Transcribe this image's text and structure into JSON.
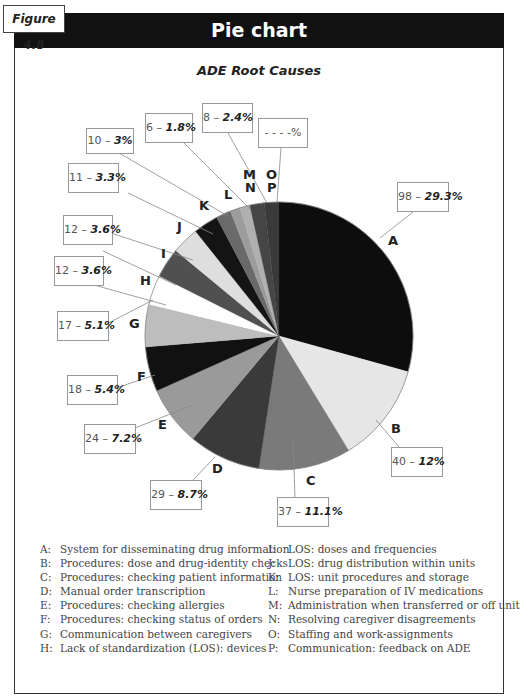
{
  "figure_label": "Figure 4.8",
  "header_title": "Pie chart",
  "chart_data": {
    "type": "pie",
    "title": "ADE Root Causes",
    "start_angle": "12 o'clock, clockwise",
    "slices": [
      {
        "key": "A",
        "count": 98,
        "percent": 29.3,
        "label": "System for disseminating drug information",
        "color": "#0d0d0d"
      },
      {
        "key": "B",
        "count": 40,
        "percent": 12,
        "label": "Procedures: dose and drug-identity checks",
        "color": "#e6e6e6"
      },
      {
        "key": "C",
        "count": 37,
        "percent": 11.1,
        "label": "Procedures: checking patient information",
        "color": "#7a7a7a"
      },
      {
        "key": "D",
        "count": 29,
        "percent": 8.7,
        "label": "Manual order transcription",
        "color": "#3a3a3a"
      },
      {
        "key": "E",
        "count": 24,
        "percent": 7.2,
        "label": "Procedures: checking allergies",
        "color": "#9a9a9a"
      },
      {
        "key": "F",
        "count": 18,
        "percent": 5.4,
        "label": "Procedures: checking status of orders",
        "color": "#111111"
      },
      {
        "key": "G",
        "count": 17,
        "percent": 5.1,
        "label": "Communication between caregivers",
        "color": "#bdbdbd"
      },
      {
        "key": "H",
        "count": 12,
        "percent": 3.6,
        "label": "Lack of standardization (LOS): devices",
        "color": "#ffffff"
      },
      {
        "key": "I",
        "count": 12,
        "percent": 3.6,
        "label": "LOS: doses and frequencies",
        "color": "#505050"
      },
      {
        "key": "J",
        "count": 11,
        "percent": 3.3,
        "label": "LOS: drug distribution within units",
        "color": "#dedede"
      },
      {
        "key": "K",
        "count": 10,
        "percent": 3,
        "label": "LOS: unit procedures and storage",
        "color": "#141414"
      },
      {
        "key": "L",
        "count": 6,
        "percent": 1.8,
        "label": "Nurse preparation of IV medications",
        "color": "#6a6a6a"
      },
      {
        "key": "M",
        "count": null,
        "percent": null,
        "label": "Administration when transferred or off unit",
        "color": "#9c9c9c"
      },
      {
        "key": "N",
        "count": null,
        "percent": null,
        "label": "Resolving caregiver disagreements",
        "color": "#b0b0b0"
      },
      {
        "key": "O",
        "count": null,
        "percent": null,
        "label": "Staffing and work-assignments",
        "color": "#454545"
      },
      {
        "key": "P",
        "count": null,
        "percent": null,
        "label": "Communication: feedback on ADE",
        "color": "#3a3a3a"
      }
    ],
    "grouped_callouts": [
      {
        "keys": [
          "M",
          "N"
        ],
        "count": 8,
        "percent": 2.4
      },
      {
        "keys": [
          "O",
          "P"
        ],
        "count": null,
        "percent": null,
        "text": "- - - -%"
      }
    ]
  },
  "callouts": [
    {
      "key": "A",
      "count": "98",
      "pct": "29.3%"
    },
    {
      "key": "B",
      "count": "40",
      "pct": "12%"
    },
    {
      "key": "C",
      "count": "37",
      "pct": "11.1%"
    },
    {
      "key": "D",
      "count": "29",
      "pct": "8.7%"
    },
    {
      "key": "E",
      "count": "24",
      "pct": "7.2%"
    },
    {
      "key": "F",
      "count": "18",
      "pct": "5.4%"
    },
    {
      "key": "G",
      "count": "17",
      "pct": "5.1%"
    },
    {
      "key": "H",
      "count": "12",
      "pct": "3.6%"
    },
    {
      "key": "I",
      "count": "12",
      "pct": "3.6%"
    },
    {
      "key": "J",
      "count": "11",
      "pct": "3.3%"
    },
    {
      "key": "K",
      "count": "10",
      "pct": "3%"
    },
    {
      "key": "L",
      "count": "6",
      "pct": "1.8%"
    },
    {
      "key": "MN",
      "count": "8",
      "pct": "2.4%"
    },
    {
      "key": "OP",
      "count": "",
      "pct": "- - - -%"
    }
  ],
  "slice_letters": [
    "A",
    "B",
    "C",
    "D",
    "E",
    "F",
    "G",
    "H",
    "I",
    "J",
    "K",
    "L",
    "M",
    "N",
    "O",
    "P"
  ],
  "legend": {
    "left": [
      {
        "key": "A:",
        "text": "System for disseminating drug information"
      },
      {
        "key": "B:",
        "text": "Procedures: dose and drug-identity checks"
      },
      {
        "key": "C:",
        "text": "Procedures: checking patient information"
      },
      {
        "key": "D:",
        "text": "Manual order transcription"
      },
      {
        "key": "E:",
        "text": "Procedures: checking allergies"
      },
      {
        "key": "F:",
        "text": "Procedures: checking status of orders"
      },
      {
        "key": "G:",
        "text": "Communication between caregivers"
      },
      {
        "key": "H:",
        "text": "Lack of standardization (LOS): devices"
      }
    ],
    "right": [
      {
        "key": "I:",
        "text": "LOS: doses and frequencies"
      },
      {
        "key": "J:",
        "text": "LOS: drug distribution within units"
      },
      {
        "key": "K:",
        "text": "LOS: unit procedures and storage"
      },
      {
        "key": "L:",
        "text": "Nurse preparation of IV medications"
      },
      {
        "key": "M:",
        "text": "Administration when transferred or off unit"
      },
      {
        "key": "N:",
        "text": "Resolving caregiver disagreements"
      },
      {
        "key": "O:",
        "text": "Staffing and work-assignments"
      },
      {
        "key": "P:",
        "text": "Communication: feedback on ADE"
      }
    ]
  }
}
